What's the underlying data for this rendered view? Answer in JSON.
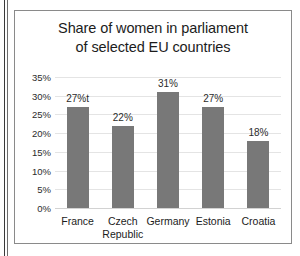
{
  "chart_data": {
    "type": "bar",
    "title": "Share of women in parliament of selected EU countries",
    "title_lines": [
      "Share of women in parliament",
      "of selected EU countries"
    ],
    "categories": [
      "France",
      "Czech Republic",
      "Germany",
      "Estonia",
      "Croatia"
    ],
    "category_lines": [
      [
        "France"
      ],
      [
        "Czech",
        "Republic"
      ],
      [
        "Germany"
      ],
      [
        "Estonia"
      ],
      [
        "Croatia"
      ]
    ],
    "values": [
      27,
      22,
      31,
      27,
      18
    ],
    "data_labels": [
      "27%t",
      "22%",
      "31%",
      "27%",
      "18%"
    ],
    "xlabel": "",
    "ylabel": "",
    "ylim": [
      0,
      35
    ],
    "ytick_values": [
      0,
      5,
      10,
      15,
      20,
      25,
      30,
      35
    ],
    "ytick_labels": [
      "0%",
      "5%",
      "10%",
      "15%",
      "20%",
      "25%",
      "30%",
      "35%"
    ],
    "grid": true,
    "legend": false,
    "bar_color": "#787878",
    "gridline_color": "#e4e4e4",
    "text_color": "#1c1c1c",
    "border_color": "#8a8a8a",
    "background": "#ffffff"
  }
}
